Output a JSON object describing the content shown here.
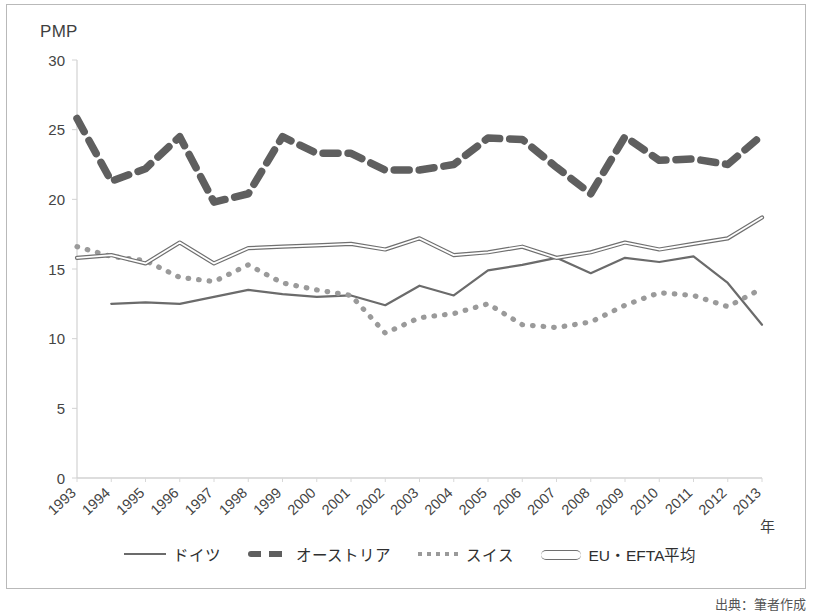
{
  "chart_data": {
    "type": "line",
    "title": "",
    "ylabel": "PMP",
    "xlabel": "年",
    "ylim": [
      0,
      30
    ],
    "yticks": [
      0,
      5,
      10,
      15,
      20,
      25,
      30
    ],
    "grid": false,
    "legend_position": "bottom",
    "categories": [
      "1993",
      "1994",
      "1995",
      "1996",
      "1997",
      "1998",
      "1999",
      "2000",
      "2001",
      "2002",
      "2003",
      "2004",
      "2005",
      "2006",
      "2007",
      "2008",
      "2009",
      "2010",
      "2011",
      "2012",
      "2013"
    ],
    "series": [
      {
        "name": "ドイツ",
        "style": "solid",
        "color": "#6b6b6b",
        "values": [
          null,
          12.5,
          12.6,
          12.5,
          13.0,
          13.5,
          13.2,
          13.0,
          13.1,
          12.4,
          13.8,
          13.1,
          14.9,
          15.3,
          15.8,
          14.7,
          15.8,
          15.5,
          15.9,
          14.0,
          11.0
        ]
      },
      {
        "name": "オーストリア",
        "style": "dashed",
        "color": "#5f5f5f",
        "values": [
          25.8,
          21.3,
          22.2,
          24.5,
          19.8,
          20.4,
          24.5,
          23.3,
          23.3,
          22.1,
          22.1,
          22.5,
          24.4,
          24.3,
          22.3,
          20.4,
          24.5,
          22.8,
          22.9,
          22.5,
          24.6
        ]
      },
      {
        "name": "スイス",
        "style": "dotted",
        "color": "#9a9a9a",
        "values": [
          16.6,
          15.9,
          15.6,
          14.4,
          14.1,
          15.3,
          14.0,
          13.5,
          13.1,
          10.4,
          11.5,
          11.8,
          12.5,
          11.0,
          10.8,
          11.2,
          12.4,
          13.3,
          13.1,
          12.3,
          13.6
        ]
      },
      {
        "name": "EU・EFTA平均",
        "style": "double",
        "color": "#707070",
        "values": [
          15.8,
          16.0,
          15.4,
          16.9,
          15.4,
          16.5,
          16.6,
          16.7,
          16.8,
          16.4,
          17.2,
          16.0,
          16.2,
          16.6,
          15.8,
          16.2,
          16.9,
          16.4,
          16.8,
          17.2,
          18.7
        ]
      }
    ]
  },
  "legend": {
    "items": [
      {
        "label": "ドイツ"
      },
      {
        "label": "オーストリア"
      },
      {
        "label": "スイス"
      },
      {
        "label": "EU・EFTA平均"
      }
    ]
  },
  "footer": {
    "source": "出典：筆者作成"
  }
}
